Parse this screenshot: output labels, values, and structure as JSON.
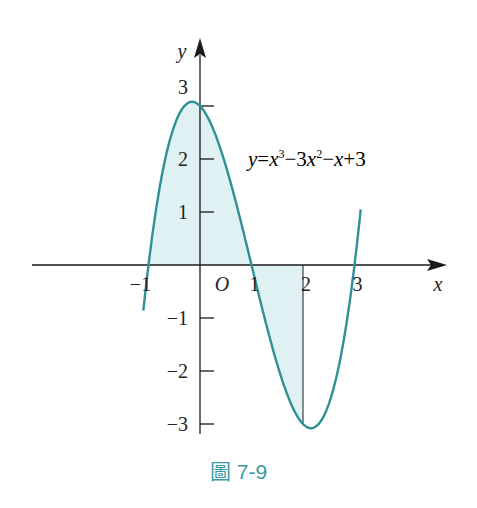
{
  "figure": {
    "caption": "圖 7-9",
    "equation_label": "y = x³ − 3x² − x + 3",
    "colors": {
      "curve": "#2f9096",
      "shade": "#dff1f3",
      "axis": "#1a1a1a",
      "caption": "#3a9aa3"
    }
  },
  "chart_data": {
    "type": "line",
    "title": "",
    "function": "y = x^3 - 3x^2 - x + 3",
    "xlabel": "x",
    "ylabel": "y",
    "origin_label": "O",
    "x_tick_labels": [
      "-1",
      "1",
      "2",
      "3"
    ],
    "y_tick_labels": [
      "3",
      "2",
      "1",
      "-1",
      "-2",
      "-3"
    ],
    "x_range": [
      -1.1,
      3.12
    ],
    "ylim": [
      -3.2,
      3.3
    ],
    "roots": [
      -1,
      1,
      3
    ],
    "shaded_region": {
      "from_x": -1,
      "to_x": 2,
      "description": "area between curve and x-axis from x=-1 to x=2"
    },
    "vertical_line_x": 2,
    "series": [
      {
        "name": "y = x^3 - 3x^2 - x + 3",
        "x": [
          -1.1,
          -1,
          -0.5,
          -0.155,
          0,
          0.5,
          1,
          1.5,
          2,
          2.155,
          2.5,
          3,
          3.12
        ],
        "values": [
          -0.66,
          0,
          2.63,
          3.08,
          3,
          1.875,
          0,
          -1.875,
          -3,
          -3.08,
          -2.625,
          0,
          1.02
        ]
      }
    ],
    "grid": false,
    "legend": "none"
  }
}
